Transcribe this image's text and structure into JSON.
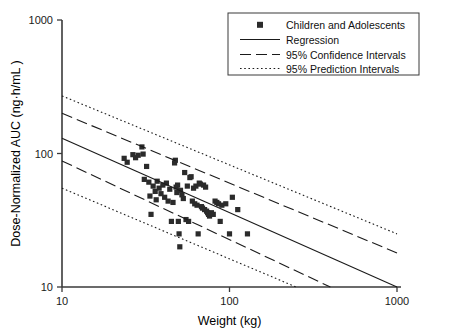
{
  "chart_data": {
    "type": "scatter",
    "title": "",
    "xlabel": "Weight (kg)",
    "ylabel": "Dose-Normalized AUC (ng·h/mL )",
    "xscale": "log",
    "yscale": "log",
    "xlim": [
      10,
      1000
    ],
    "ylim": [
      10,
      1000
    ],
    "xticks": [
      10,
      100,
      1000
    ],
    "xtick_labels": [
      "10",
      "100",
      "1000"
    ],
    "yticks": [
      10,
      100,
      1000
    ],
    "ytick_labels": [
      "10",
      "100",
      "1000"
    ],
    "grid": false,
    "legend_position": "top-right",
    "marker_color": "#2b2b2b",
    "line_color": "#1a1a1a",
    "legend": [
      {
        "label": "Children and Adolescents",
        "style": "marker"
      },
      {
        "label": "Regression",
        "style": "solid"
      },
      {
        "label": "95% Confidence Intervals",
        "style": "dashed"
      },
      {
        "label": "95% Prediction Intervals",
        "style": "dotted"
      }
    ],
    "series": [
      {
        "name": "Children and Adolescents",
        "style": "marker",
        "points": [
          [
            23.5,
            92
          ],
          [
            24.5,
            86
          ],
          [
            26.5,
            98
          ],
          [
            27.5,
            93
          ],
          [
            28.5,
            97
          ],
          [
            30.0,
            112
          ],
          [
            30.5,
            99
          ],
          [
            31.0,
            64
          ],
          [
            32.0,
            80
          ],
          [
            33.0,
            61
          ],
          [
            33.5,
            48
          ],
          [
            34.0,
            35
          ],
          [
            35.0,
            57
          ],
          [
            36.0,
            52
          ],
          [
            36.5,
            45
          ],
          [
            37.0,
            62
          ],
          [
            38.0,
            55
          ],
          [
            39.0,
            50
          ],
          [
            40.0,
            58
          ],
          [
            41.0,
            47
          ],
          [
            42.0,
            60
          ],
          [
            43.0,
            44
          ],
          [
            44.0,
            54
          ],
          [
            45.0,
            31
          ],
          [
            46.0,
            43
          ],
          [
            47.0,
            85
          ],
          [
            47.5,
            89
          ],
          [
            48.0,
            56
          ],
          [
            48.5,
            51
          ],
          [
            49.0,
            58
          ],
          [
            49.5,
            31
          ],
          [
            50.0,
            25
          ],
          [
            50.5,
            20
          ],
          [
            51.0,
            53
          ],
          [
            52.0,
            49
          ],
          [
            53.0,
            46
          ],
          [
            54.0,
            72
          ],
          [
            55.0,
            32
          ],
          [
            56.0,
            57
          ],
          [
            57.0,
            31
          ],
          [
            58.0,
            66
          ],
          [
            59.0,
            67
          ],
          [
            60.0,
            44
          ],
          [
            61.0,
            55
          ],
          [
            62.0,
            42
          ],
          [
            63.0,
            57
          ],
          [
            64.0,
            41
          ],
          [
            65.0,
            25
          ],
          [
            66.0,
            60
          ],
          [
            67.0,
            59
          ],
          [
            68.0,
            40
          ],
          [
            69.0,
            39
          ],
          [
            70.0,
            58
          ],
          [
            71.0,
            38
          ],
          [
            72.0,
            56
          ],
          [
            73.0,
            37
          ],
          [
            74.0,
            36
          ],
          [
            75.0,
            35
          ],
          [
            76.0,
            34
          ],
          [
            78.0,
            36
          ],
          [
            80.0,
            35
          ],
          [
            82.0,
            44
          ],
          [
            84.0,
            43
          ],
          [
            86.0,
            42
          ],
          [
            88.0,
            31
          ],
          [
            90.0,
            41
          ],
          [
            95.0,
            42
          ],
          [
            100.0,
            25
          ],
          [
            104.0,
            47
          ],
          [
            112.0,
            38
          ],
          [
            128.0,
            25
          ]
        ]
      },
      {
        "name": "Regression",
        "style": "solid",
        "x": [
          10,
          1000
        ],
        "y": [
          130,
          10
        ]
      },
      {
        "name": "95% Confidence Intervals",
        "style": "dashed",
        "upper": {
          "x": [
            10,
            1000
          ],
          "y": [
            200,
            18
          ]
        },
        "lower": {
          "x": [
            10,
            400
          ],
          "y": [
            88,
            10
          ]
        }
      },
      {
        "name": "95% Prediction Intervals",
        "style": "dotted",
        "upper": {
          "x": [
            10,
            1000
          ],
          "y": [
            270,
            25
          ]
        },
        "lower": {
          "x": [
            10,
            250
          ],
          "y": [
            55,
            10
          ]
        }
      }
    ]
  }
}
